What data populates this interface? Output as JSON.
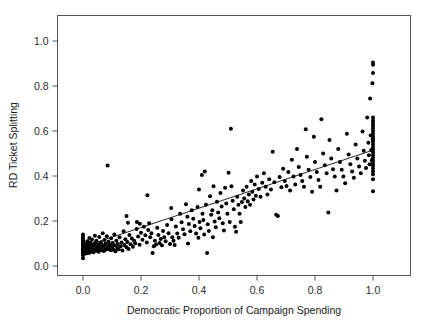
{
  "figure": {
    "background_color": "#ffffff",
    "frame_color": "#555555",
    "point_color": "#000000",
    "line_color": "#111111",
    "width": 429,
    "height": 326
  },
  "chart_data": {
    "type": "scatter",
    "title": "",
    "xlabel": "Democratic Proportion of Campaign Spending",
    "ylabel": "RD Ticket Splitting",
    "xlim": [
      -0.08,
      1.1
    ],
    "ylim": [
      -0.09,
      1.09
    ],
    "xticks": [
      0.0,
      0.2,
      0.4,
      0.6,
      0.8,
      1.0
    ],
    "xticklabels": [
      "0.0",
      "0.2",
      "0.4",
      "0.6",
      "0.8",
      "1.0"
    ],
    "yticks": [
      0.0,
      0.2,
      0.4,
      0.6,
      0.8,
      1.0
    ],
    "yticklabels": [
      "0.0",
      "0.2",
      "0.4",
      "0.6",
      "0.8",
      "1.0"
    ],
    "grid": false,
    "legend": null,
    "marker": "filled-circle",
    "marker_size_px": 4,
    "fit_line": {
      "type": "linear-regression",
      "x_start": 0.0,
      "y_start": 0.085,
      "x_end": 1.0,
      "y_end": 0.515,
      "slope": 0.43,
      "intercept": 0.085
    },
    "points": [
      [
        0.0,
        0.035
      ],
      [
        0.0,
        0.048
      ],
      [
        0.0,
        0.055
      ],
      [
        0.0,
        0.06
      ],
      [
        0.0,
        0.063
      ],
      [
        0.0,
        0.068
      ],
      [
        0.0,
        0.072
      ],
      [
        0.0,
        0.075
      ],
      [
        0.0,
        0.08
      ],
      [
        0.0,
        0.085
      ],
      [
        0.0,
        0.09
      ],
      [
        0.0,
        0.095
      ],
      [
        0.0,
        0.1
      ],
      [
        0.0,
        0.107
      ],
      [
        0.0,
        0.115
      ],
      [
        0.0,
        0.122
      ],
      [
        0.0,
        0.13
      ],
      [
        0.0,
        0.14
      ],
      [
        0.003,
        0.052
      ],
      [
        0.004,
        0.066
      ],
      [
        0.005,
        0.078
      ],
      [
        0.006,
        0.092
      ],
      [
        0.007,
        0.058
      ],
      [
        0.008,
        0.07
      ],
      [
        0.009,
        0.084
      ],
      [
        0.01,
        0.062
      ],
      [
        0.011,
        0.099
      ],
      [
        0.012,
        0.074
      ],
      [
        0.013,
        0.088
      ],
      [
        0.014,
        0.057
      ],
      [
        0.015,
        0.11
      ],
      [
        0.016,
        0.069
      ],
      [
        0.018,
        0.081
      ],
      [
        0.019,
        0.064
      ],
      [
        0.02,
        0.093
      ],
      [
        0.021,
        0.076
      ],
      [
        0.022,
        0.125
      ],
      [
        0.023,
        0.059
      ],
      [
        0.025,
        0.104
      ],
      [
        0.026,
        0.071
      ],
      [
        0.028,
        0.086
      ],
      [
        0.03,
        0.066
      ],
      [
        0.031,
        0.118
      ],
      [
        0.033,
        0.079
      ],
      [
        0.034,
        0.095
      ],
      [
        0.036,
        0.061
      ],
      [
        0.038,
        0.073
      ],
      [
        0.04,
        0.101
      ],
      [
        0.041,
        0.135
      ],
      [
        0.043,
        0.087
      ],
      [
        0.045,
        0.068
      ],
      [
        0.046,
        0.112
      ],
      [
        0.048,
        0.082
      ],
      [
        0.05,
        0.074
      ],
      [
        0.052,
        0.097
      ],
      [
        0.054,
        0.063
      ],
      [
        0.056,
        0.129
      ],
      [
        0.058,
        0.09
      ],
      [
        0.06,
        0.077
      ],
      [
        0.062,
        0.105
      ],
      [
        0.064,
        0.07
      ],
      [
        0.066,
        0.084
      ],
      [
        0.068,
        0.146
      ],
      [
        0.07,
        0.092
      ],
      [
        0.072,
        0.067
      ],
      [
        0.074,
        0.116
      ],
      [
        0.076,
        0.08
      ],
      [
        0.078,
        0.099
      ],
      [
        0.08,
        0.073
      ],
      [
        0.082,
        0.132
      ],
      [
        0.085,
        0.447
      ],
      [
        0.086,
        0.088
      ],
      [
        0.088,
        0.108
      ],
      [
        0.09,
        0.076
      ],
      [
        0.092,
        0.094
      ],
      [
        0.095,
        0.07
      ],
      [
        0.097,
        0.123
      ],
      [
        0.1,
        0.085
      ],
      [
        0.102,
        0.102
      ],
      [
        0.105,
        0.072
      ],
      [
        0.108,
        0.14
      ],
      [
        0.11,
        0.091
      ],
      [
        0.112,
        0.066
      ],
      [
        0.115,
        0.112
      ],
      [
        0.118,
        0.08
      ],
      [
        0.12,
        0.098
      ],
      [
        0.123,
        0.074
      ],
      [
        0.126,
        0.128
      ],
      [
        0.13,
        0.088
      ],
      [
        0.133,
        0.104
      ],
      [
        0.136,
        0.069
      ],
      [
        0.14,
        0.155
      ],
      [
        0.143,
        0.093
      ],
      [
        0.146,
        0.119
      ],
      [
        0.15,
        0.083
      ],
      [
        0.153,
        0.107
      ],
      [
        0.157,
        0.076
      ],
      [
        0.16,
        0.138
      ],
      [
        0.164,
        0.097
      ],
      [
        0.168,
        0.122
      ],
      [
        0.15,
        0.222
      ],
      [
        0.155,
        0.192
      ],
      [
        0.172,
        0.086
      ],
      [
        0.176,
        0.112
      ],
      [
        0.18,
        0.101
      ],
      [
        0.185,
        0.165
      ],
      [
        0.19,
        0.131
      ],
      [
        0.195,
        0.094
      ],
      [
        0.2,
        0.148
      ],
      [
        0.205,
        0.117
      ],
      [
        0.186,
        0.196
      ],
      [
        0.196,
        0.188
      ],
      [
        0.21,
        0.175
      ],
      [
        0.215,
        0.137
      ],
      [
        0.22,
        0.105
      ],
      [
        0.222,
        0.315
      ],
      [
        0.225,
        0.16
      ],
      [
        0.228,
        0.19
      ],
      [
        0.232,
        0.128
      ],
      [
        0.236,
        0.146
      ],
      [
        0.24,
        0.058
      ],
      [
        0.244,
        0.088
      ],
      [
        0.248,
        0.112
      ],
      [
        0.252,
        0.096
      ],
      [
        0.256,
        0.17
      ],
      [
        0.26,
        0.138
      ],
      [
        0.264,
        0.102
      ],
      [
        0.268,
        0.12
      ],
      [
        0.272,
        0.092
      ],
      [
        0.276,
        0.156
      ],
      [
        0.28,
        0.128
      ],
      [
        0.285,
        0.11
      ],
      [
        0.29,
        0.182
      ],
      [
        0.295,
        0.146
      ],
      [
        0.3,
        0.098
      ],
      [
        0.304,
        0.258
      ],
      [
        0.308,
        0.128
      ],
      [
        0.312,
        0.112
      ],
      [
        0.316,
        0.093
      ],
      [
        0.32,
        0.176
      ],
      [
        0.305,
        0.208
      ],
      [
        0.325,
        0.145
      ],
      [
        0.33,
        0.126
      ],
      [
        0.335,
        0.232
      ],
      [
        0.34,
        0.195
      ],
      [
        0.345,
        0.163
      ],
      [
        0.35,
        0.141
      ],
      [
        0.355,
        0.275
      ],
      [
        0.36,
        0.219
      ],
      [
        0.362,
        0.1
      ],
      [
        0.365,
        0.187
      ],
      [
        0.37,
        0.155
      ],
      [
        0.375,
        0.248
      ],
      [
        0.38,
        0.21
      ],
      [
        0.385,
        0.178
      ],
      [
        0.39,
        0.145
      ],
      [
        0.395,
        0.262
      ],
      [
        0.398,
        0.126
      ],
      [
        0.4,
        0.34
      ],
      [
        0.402,
        0.196
      ],
      [
        0.405,
        0.168
      ],
      [
        0.41,
        0.405
      ],
      [
        0.412,
        0.232
      ],
      [
        0.415,
        0.205
      ],
      [
        0.418,
        0.14
      ],
      [
        0.42,
        0.42
      ],
      [
        0.424,
        0.272
      ],
      [
        0.428,
        0.058
      ],
      [
        0.43,
        0.186
      ],
      [
        0.434,
        0.156
      ],
      [
        0.438,
        0.31
      ],
      [
        0.442,
        0.228
      ],
      [
        0.446,
        0.248
      ],
      [
        0.448,
        0.128
      ],
      [
        0.45,
        0.355
      ],
      [
        0.454,
        0.198
      ],
      [
        0.458,
        0.172
      ],
      [
        0.462,
        0.286
      ],
      [
        0.466,
        0.238
      ],
      [
        0.47,
        0.212
      ],
      [
        0.474,
        0.325
      ],
      [
        0.478,
        0.265
      ],
      [
        0.482,
        0.19
      ],
      [
        0.486,
        0.158
      ],
      [
        0.49,
        0.348
      ],
      [
        0.494,
        0.278
      ],
      [
        0.498,
        0.232
      ],
      [
        0.502,
        0.415
      ],
      [
        0.506,
        0.196
      ],
      [
        0.51,
        0.61
      ],
      [
        0.512,
        0.355
      ],
      [
        0.516,
        0.29
      ],
      [
        0.52,
        0.252
      ],
      [
        0.524,
        0.175
      ],
      [
        0.528,
        0.152
      ],
      [
        0.532,
        0.308
      ],
      [
        0.536,
        0.272
      ],
      [
        0.54,
        0.232
      ],
      [
        0.544,
        0.196
      ],
      [
        0.548,
        0.285
      ],
      [
        0.552,
        0.336
      ],
      [
        0.556,
        0.3
      ],
      [
        0.56,
        0.262
      ],
      [
        0.564,
        0.352
      ],
      [
        0.568,
        0.288
      ],
      [
        0.572,
        0.318
      ],
      [
        0.576,
        0.272
      ],
      [
        0.58,
        0.378
      ],
      [
        0.584,
        0.33
      ],
      [
        0.588,
        0.296
      ],
      [
        0.592,
        0.362
      ],
      [
        0.596,
        0.312
      ],
      [
        0.6,
        0.398
      ],
      [
        0.606,
        0.342
      ],
      [
        0.612,
        0.308
      ],
      [
        0.618,
        0.37
      ],
      [
        0.624,
        0.412
      ],
      [
        0.63,
        0.352
      ],
      [
        0.636,
        0.318
      ],
      [
        0.642,
        0.386
      ],
      [
        0.648,
        0.34
      ],
      [
        0.654,
        0.508
      ],
      [
        0.66,
        0.372
      ],
      [
        0.666,
        0.228
      ],
      [
        0.672,
        0.222
      ],
      [
        0.678,
        0.396
      ],
      [
        0.684,
        0.35
      ],
      [
        0.69,
        0.432
      ],
      [
        0.696,
        0.378
      ],
      [
        0.702,
        0.356
      ],
      [
        0.708,
        0.418
      ],
      [
        0.714,
        0.336
      ],
      [
        0.72,
        0.472
      ],
      [
        0.726,
        0.398
      ],
      [
        0.732,
        0.362
      ],
      [
        0.738,
        0.52
      ],
      [
        0.744,
        0.44
      ],
      [
        0.75,
        0.404
      ],
      [
        0.756,
        0.378
      ],
      [
        0.762,
        0.352
      ],
      [
        0.768,
        0.608
      ],
      [
        0.772,
        0.486
      ],
      [
        0.778,
        0.428
      ],
      [
        0.784,
        0.396
      ],
      [
        0.79,
        0.33
      ],
      [
        0.796,
        0.574
      ],
      [
        0.8,
        0.462
      ],
      [
        0.806,
        0.418
      ],
      [
        0.812,
        0.382
      ],
      [
        0.818,
        0.352
      ],
      [
        0.822,
        0.652
      ],
      [
        0.828,
        0.5
      ],
      [
        0.834,
        0.448
      ],
      [
        0.84,
        0.412
      ],
      [
        0.846,
        0.238
      ],
      [
        0.85,
        0.56
      ],
      [
        0.856,
        0.478
      ],
      [
        0.862,
        0.43
      ],
      [
        0.868,
        0.398
      ],
      [
        0.874,
        0.336
      ],
      [
        0.88,
        0.52
      ],
      [
        0.886,
        0.462
      ],
      [
        0.892,
        0.428
      ],
      [
        0.898,
        0.398
      ],
      [
        0.904,
        0.368
      ],
      [
        0.91,
        0.588
      ],
      [
        0.916,
        0.496
      ],
      [
        0.922,
        0.452
      ],
      [
        0.928,
        0.42
      ],
      [
        0.934,
        0.392
      ],
      [
        0.94,
        0.54
      ],
      [
        0.946,
        0.478
      ],
      [
        0.952,
        0.442
      ],
      [
        0.958,
        0.412
      ],
      [
        0.964,
        0.598
      ],
      [
        0.968,
        0.512
      ],
      [
        0.972,
        0.468
      ],
      [
        0.976,
        0.436
      ],
      [
        0.98,
        0.66
      ],
      [
        0.984,
        0.548
      ],
      [
        0.986,
        0.492
      ],
      [
        0.988,
        0.452
      ],
      [
        0.99,
        0.745
      ],
      [
        0.992,
        0.58
      ],
      [
        0.994,
        0.516
      ],
      [
        0.996,
        0.47
      ],
      [
        0.998,
        0.812
      ],
      [
        0.999,
        0.56
      ],
      [
        1.0,
        0.905
      ],
      [
        1.0,
        0.895
      ],
      [
        1.0,
        0.858
      ],
      [
        1.0,
        0.66
      ],
      [
        1.0,
        0.648
      ],
      [
        1.0,
        0.636
      ],
      [
        1.0,
        0.624
      ],
      [
        1.0,
        0.612
      ],
      [
        1.0,
        0.6
      ],
      [
        1.0,
        0.588
      ],
      [
        1.0,
        0.576
      ],
      [
        1.0,
        0.564
      ],
      [
        1.0,
        0.552
      ],
      [
        1.0,
        0.54
      ],
      [
        1.0,
        0.528
      ],
      [
        1.0,
        0.516
      ],
      [
        1.0,
        0.504
      ],
      [
        1.0,
        0.492
      ],
      [
        1.0,
        0.48
      ],
      [
        1.0,
        0.468
      ],
      [
        1.0,
        0.456
      ],
      [
        1.0,
        0.444
      ],
      [
        1.0,
        0.432
      ],
      [
        1.0,
        0.42
      ],
      [
        1.0,
        0.408
      ],
      [
        1.0,
        0.386
      ],
      [
        1.0,
        0.332
      ]
    ]
  }
}
